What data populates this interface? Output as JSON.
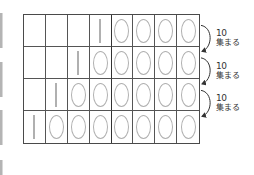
{
  "diagram": {
    "type": "place-value-table",
    "columns": 8,
    "rows": [
      [
        "",
        "",
        "",
        "1",
        "0",
        "0",
        "0",
        "0"
      ],
      [
        "",
        "",
        "1",
        "0",
        "0",
        "0",
        "0",
        "0"
      ],
      [
        "",
        "1",
        "0",
        "0",
        "0",
        "0",
        "0",
        "0"
      ],
      [
        "1",
        "0",
        "0",
        "0",
        "0",
        "0",
        "0",
        "0"
      ]
    ],
    "arrows": [
      {
        "from_row": 1,
        "to_row": 2,
        "count": "10",
        "text": "集まる"
      },
      {
        "from_row": 2,
        "to_row": 3,
        "count": "10",
        "text": "集まる"
      },
      {
        "from_row": 3,
        "to_row": 4,
        "count": "10",
        "text": "集まる"
      }
    ],
    "colors": {
      "grid_line": "#555555",
      "digit": "#b0b0b0",
      "label": "#333333",
      "edge_bar": "#b4b4b4"
    }
  }
}
